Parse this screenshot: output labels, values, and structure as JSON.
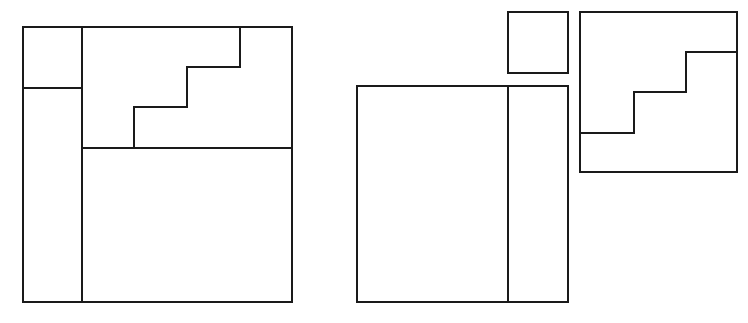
{
  "diagram": {
    "type": "geometric-dissection",
    "stroke_color": "#1a1a1a",
    "background": "#ffffff",
    "figures": [
      {
        "name": "assembled-square",
        "outer": {
          "x": 23,
          "y": 27,
          "w": 269,
          "h": 275
        },
        "lines": [
          {
            "x1": 82,
            "y1": 27,
            "x2": 82,
            "y2": 302
          },
          {
            "x1": 23,
            "y1": 88,
            "x2": 82,
            "y2": 88
          },
          {
            "x1": 82,
            "y1": 148,
            "x2": 292,
            "y2": 148
          }
        ],
        "staircase": [
          [
            134,
            148
          ],
          [
            134,
            107
          ],
          [
            187,
            107
          ],
          [
            187,
            67
          ],
          [
            240,
            67
          ],
          [
            240,
            27
          ]
        ]
      },
      {
        "name": "small-square-piece",
        "outer": {
          "x": 508,
          "y": 12,
          "w": 60,
          "h": 61
        }
      },
      {
        "name": "split-rectangle-piece",
        "outer": {
          "x": 357,
          "y": 86,
          "w": 211,
          "h": 216
        },
        "lines": [
          {
            "x1": 508,
            "y1": 86,
            "x2": 508,
            "y2": 302
          }
        ]
      },
      {
        "name": "staircase-square-piece",
        "outer": {
          "x": 580,
          "y": 12,
          "w": 157,
          "h": 160
        },
        "staircase": [
          [
            580,
            133
          ],
          [
            634,
            133
          ],
          [
            634,
            92
          ],
          [
            686,
            92
          ],
          [
            686,
            52
          ],
          [
            737,
            52
          ]
        ]
      }
    ]
  }
}
